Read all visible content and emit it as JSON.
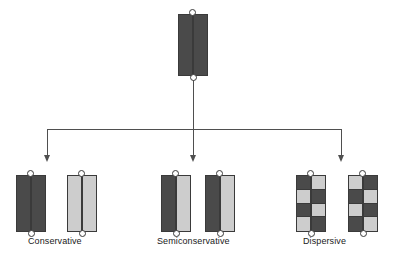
{
  "figure": {
    "background_color": "#ffffff"
  },
  "colors": {
    "dark_strand": "#4a4a4a",
    "light_strand": "#cdcdcd",
    "outline": "#3a3a3a",
    "connector": "#4f4f4f",
    "label_text": "#1a1a1a"
  },
  "parent": {
    "name": "parental-dna-molecule",
    "strands": [
      {
        "position": "left",
        "pattern": [
          "dark"
        ]
      },
      {
        "position": "right",
        "pattern": [
          "dark"
        ]
      }
    ],
    "loops": 2
  },
  "branches": [
    {
      "id": "conservative",
      "label": "Conservative",
      "molecules": [
        {
          "name": "conservative-molecule-1",
          "strands": [
            {
              "position": "left",
              "pattern": [
                "dark"
              ]
            },
            {
              "position": "right",
              "pattern": [
                "dark"
              ]
            }
          ]
        },
        {
          "name": "conservative-molecule-2",
          "strands": [
            {
              "position": "left",
              "pattern": [
                "light"
              ]
            },
            {
              "position": "right",
              "pattern": [
                "light"
              ]
            }
          ]
        }
      ]
    },
    {
      "id": "semiconservative",
      "label": "Semiconservative",
      "molecules": [
        {
          "name": "semiconservative-molecule-1",
          "strands": [
            {
              "position": "left",
              "pattern": [
                "dark"
              ]
            },
            {
              "position": "right",
              "pattern": [
                "light"
              ]
            }
          ]
        },
        {
          "name": "semiconservative-molecule-2",
          "strands": [
            {
              "position": "left",
              "pattern": [
                "dark"
              ]
            },
            {
              "position": "right",
              "pattern": [
                "light"
              ]
            }
          ]
        }
      ]
    },
    {
      "id": "dispersive",
      "label": "Dispersive",
      "molecules": [
        {
          "name": "dispersive-molecule-1",
          "strands": [
            {
              "position": "left",
              "pattern": [
                "dark",
                "light",
                "dark",
                "light"
              ]
            },
            {
              "position": "right",
              "pattern": [
                "light",
                "dark",
                "light",
                "dark"
              ]
            }
          ]
        },
        {
          "name": "dispersive-molecule-2",
          "strands": [
            {
              "position": "left",
              "pattern": [
                "light",
                "dark",
                "light",
                "dark"
              ]
            },
            {
              "position": "right",
              "pattern": [
                "dark",
                "light",
                "dark",
                "light"
              ]
            }
          ]
        }
      ]
    }
  ],
  "labels": {
    "conservative": "Conservative",
    "semiconservative": "Semiconservative",
    "dispersive": "Dispersive"
  }
}
